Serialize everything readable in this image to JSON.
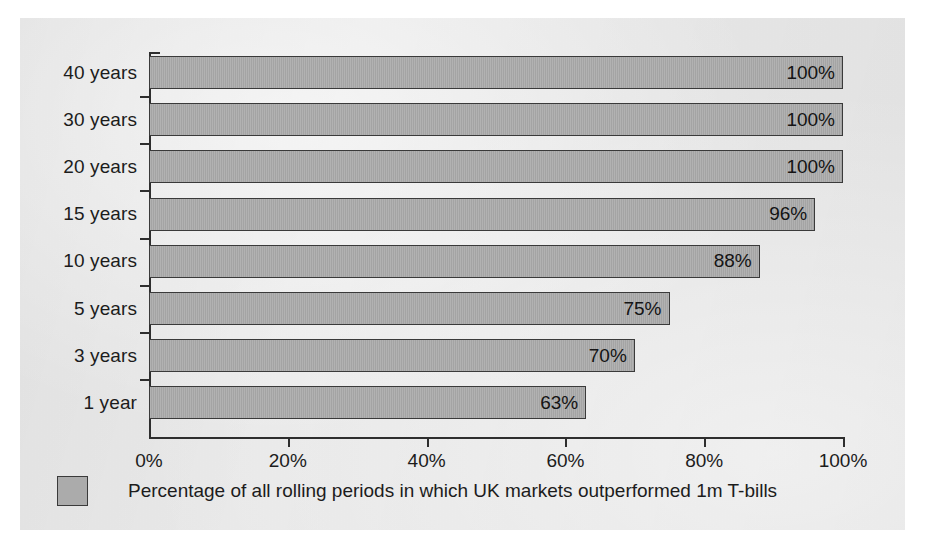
{
  "chart_data": {
    "type": "bar",
    "orientation": "horizontal",
    "title": "",
    "subtitle": "",
    "xlabel": "",
    "ylabel": "",
    "categories": [
      "40 years",
      "30 years",
      "20 years",
      "15 years",
      "10 years",
      "5 years",
      "3 years",
      "1 year"
    ],
    "values": [
      100,
      100,
      100,
      96,
      88,
      75,
      70,
      63
    ],
    "value_labels": [
      "100%",
      "100%",
      "100%",
      "96%",
      "88%",
      "75%",
      "70%",
      "63%"
    ],
    "xlim": [
      0,
      100
    ],
    "xticks": [
      0,
      20,
      40,
      60,
      80,
      100
    ],
    "xtick_labels": [
      "0%",
      "20%",
      "40%",
      "60%",
      "80%",
      "100%"
    ],
    "grid": false,
    "legend": {
      "position": "bottom-left",
      "entries": [
        {
          "label": "Percentage of all rolling periods in which UK markets outperformed 1m T-bills",
          "color": "#ababab"
        }
      ]
    },
    "series": [
      {
        "name": "Percentage of all rolling periods in which UK markets outperformed 1m T-bills",
        "color": "#ababab",
        "values": [
          100,
          100,
          100,
          96,
          88,
          75,
          70,
          63
        ]
      }
    ],
    "colors": {
      "bar_fill": "#ababab",
      "bar_border": "#3a3a3a",
      "axis": "#2e2e2e",
      "text": "#1c1c1c",
      "panel_background": "#ececec",
      "page_background": "#ffffff"
    }
  }
}
